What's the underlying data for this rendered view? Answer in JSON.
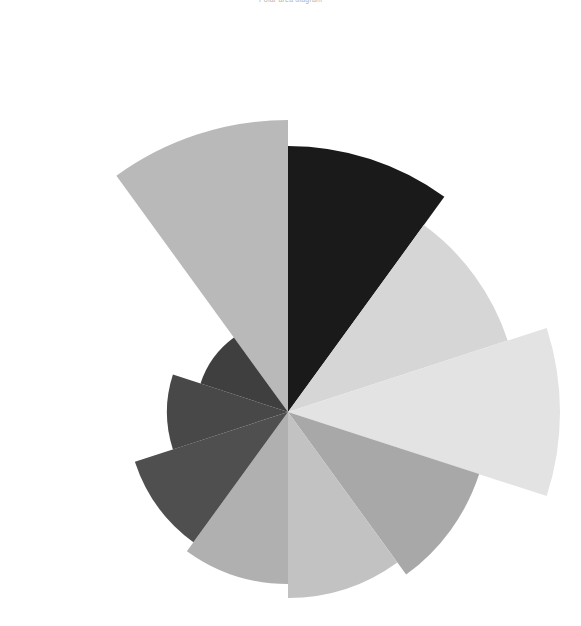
{
  "chart_data": {
    "type": "pie",
    "variant": "polar-area-rose",
    "title": "Polar area diagram",
    "subtitle": "",
    "xlabel": "",
    "ylabel": "",
    "background": "#ffffff",
    "legend": "none",
    "grid": false,
    "center": {
      "x": 288,
      "y": 412
    },
    "sector_count": 10,
    "sector_angle_deg": 36,
    "start_angle_deg": -126,
    "direction": "clockwise",
    "rmax": 292,
    "rlim": [
      0,
      292
    ],
    "categories": [
      "Segment 1",
      "Segment 2",
      "Segment 3",
      "Segment 4",
      "Segment 5",
      "Segment 6",
      "Segment 7",
      "Segment 8",
      "Segment 9",
      "Segment 10"
    ],
    "values": [
      292,
      266,
      231,
      272,
      201,
      186,
      172,
      161,
      121,
      92
    ],
    "colors": [
      "#b9b9b9",
      "#1a1a1a",
      "#d6d6d6",
      "#e3e3e3",
      "#a8a8a8",
      "#c2c2c2",
      "#b0b0b0",
      "#4f4f4f",
      "#484848",
      "#3f3f3f"
    ],
    "sectors": [
      {
        "label": "Segment 1",
        "value": 292,
        "radius": 292,
        "color": "#b9b9b9",
        "start_deg": -126,
        "end_deg": -90
      },
      {
        "label": "Segment 2",
        "value": 266,
        "radius": 266,
        "color": "#1a1a1a",
        "start_deg": -90,
        "end_deg": -54
      },
      {
        "label": "Segment 3",
        "value": 231,
        "radius": 231,
        "color": "#d6d6d6",
        "start_deg": -54,
        "end_deg": -18
      },
      {
        "label": "Segment 4",
        "value": 272,
        "radius": 272,
        "color": "#e3e3e3",
        "start_deg": -18,
        "end_deg": 18
      },
      {
        "label": "Segment 5",
        "value": 201,
        "radius": 201,
        "color": "#a8a8a8",
        "start_deg": 18,
        "end_deg": 54
      },
      {
        "label": "Segment 6",
        "value": 186,
        "radius": 186,
        "color": "#c2c2c2",
        "start_deg": 54,
        "end_deg": 90
      },
      {
        "label": "Segment 7",
        "value": 172,
        "radius": 172,
        "color": "#b0b0b0",
        "start_deg": 90,
        "end_deg": 126
      },
      {
        "label": "Segment 8",
        "value": 161,
        "radius": 161,
        "color": "#4f4f4f",
        "start_deg": 126,
        "end_deg": 162
      },
      {
        "label": "Segment 9",
        "value": 121,
        "radius": 121,
        "color": "#484848",
        "start_deg": 162,
        "end_deg": 198
      },
      {
        "label": "Segment 10",
        "value": 92,
        "radius": 92,
        "color": "#3f3f3f",
        "start_deg": 198,
        "end_deg": 234
      }
    ]
  }
}
